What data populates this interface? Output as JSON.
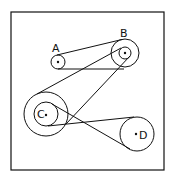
{
  "diagram": {
    "stroke_color": "#111111",
    "frame": {
      "x": 11,
      "y": 12,
      "w": 153,
      "h": 158
    },
    "pulleys": [
      {
        "id": "A",
        "label": "A",
        "cx": 58,
        "cy": 62,
        "r": 7
      },
      {
        "id": "B",
        "label": "B",
        "cx": 125,
        "cy": 53,
        "r_outer": 14,
        "r_inner": 6
      },
      {
        "id": "C",
        "label": "C",
        "cx": 46,
        "cy": 114,
        "r_outer": 22,
        "r_inner": 12
      },
      {
        "id": "D",
        "label": "D",
        "cx": 137,
        "cy": 134,
        "r": 17
      }
    ],
    "belts": [
      {
        "from": "A",
        "to": "B (outer)"
      },
      {
        "from": "B (inner)",
        "to": "C (outer)"
      },
      {
        "from": "C (inner)",
        "to": "D",
        "crossed": true
      }
    ]
  }
}
